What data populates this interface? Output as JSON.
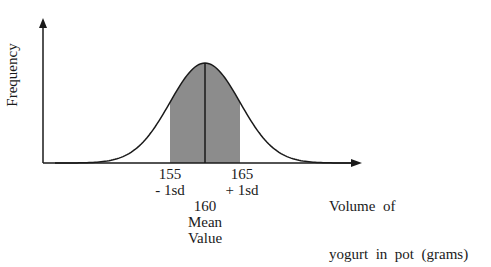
{
  "chart_data": {
    "type": "area",
    "title": "",
    "ylabel": "Frequency",
    "xlabel": "Volume of yogurt in pot (grams)",
    "xlabel_lines": [
      "Volume  of",
      "yogurt  in  pot  (grams)"
    ],
    "distribution": "normal",
    "mean": 160,
    "sd": 5,
    "shaded_region": [
      155,
      165
    ],
    "annotations": [
      {
        "value": 155,
        "lines": [
          "155",
          "- 1sd"
        ]
      },
      {
        "value": 165,
        "lines": [
          "165",
          "+ 1sd"
        ]
      },
      {
        "value": 160,
        "lines": [
          "160",
          "Mean",
          "Value"
        ]
      }
    ],
    "grid": false,
    "legend": null
  },
  "colors": {
    "shade": "#8c8c8c",
    "line": "#1a1a1a"
  }
}
